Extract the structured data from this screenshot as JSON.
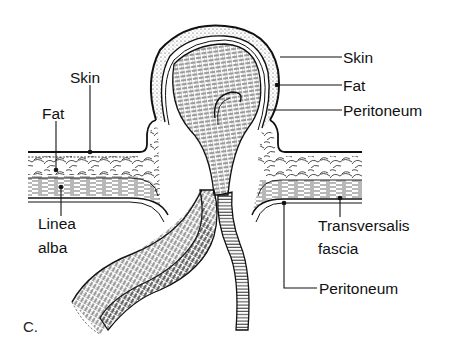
{
  "figure": {
    "panel_label": "C.",
    "labels": {
      "skin_left": "Skin",
      "fat_left": "Fat",
      "linea_alba_line1": "Linea",
      "linea_alba_line2": "alba",
      "skin_right": "Skin",
      "fat_right": "Fat",
      "peritoneum_sac": "Peritoneum",
      "transversalis_line1": "Transversalis",
      "transversalis_line2": "fascia",
      "peritoneum_wall": "Peritoneum"
    },
    "colors": {
      "ink": "#111111",
      "background": "#ffffff"
    }
  }
}
